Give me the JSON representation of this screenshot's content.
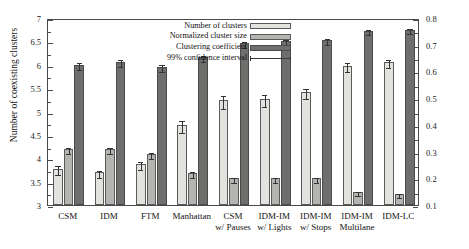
{
  "chart_data": {
    "type": "bar",
    "title": "",
    "categories": [
      "CSM",
      "IDM",
      "FTM",
      "Manhattan",
      "CSM\nw/ Pauses",
      "IDM-IM\nw/ Lights",
      "IDM-IM\nw/ Stops",
      "IDM-IM\nMultilane",
      "IDM-LC"
    ],
    "category_lines": [
      [
        "CSM",
        ""
      ],
      [
        "IDM",
        ""
      ],
      [
        "FTM",
        ""
      ],
      [
        "Manhattan",
        ""
      ],
      [
        "CSM",
        "w/ Pauses"
      ],
      [
        "IDM-IM",
        "w/ Lights"
      ],
      [
        "IDM-IM",
        "w/ Stops"
      ],
      [
        "IDM-IM",
        "Multilane"
      ],
      [
        "IDM-LC",
        ""
      ]
    ],
    "series": [
      {
        "name": "Number of clusters",
        "axis": "left",
        "color": "#e2e2de",
        "values": [
          3.78,
          3.7,
          3.88,
          4.72,
          5.24,
          5.26,
          5.42,
          5.98,
          6.06
        ],
        "errors": [
          0.1,
          0.08,
          0.08,
          0.13,
          0.14,
          0.13,
          0.11,
          0.1,
          0.09
        ]
      },
      {
        "name": "Normalized cluster size",
        "axis": "right",
        "color": "#b4b4b0",
        "values": [
          0.31,
          0.31,
          0.29,
          0.22,
          0.2,
          0.2,
          0.2,
          0.15,
          0.14
        ],
        "errors": [
          0.012,
          0.012,
          0.012,
          0.01,
          0.009,
          0.009,
          0.009,
          0.008,
          0.008
        ]
      },
      {
        "name": "Clustering coefficient",
        "axis": "right",
        "color": "#6e6e6c",
        "values": [
          0.625,
          0.636,
          0.617,
          0.655,
          0.705,
          0.713,
          0.718,
          0.752,
          0.757
        ],
        "errors": [
          0.014,
          0.013,
          0.013,
          0.012,
          0.011,
          0.011,
          0.01,
          0.01,
          0.01
        ]
      }
    ],
    "legend_entries": [
      {
        "label": "Number of clusters",
        "kind": "swatch",
        "series": 0
      },
      {
        "label": "Normalized cluster size",
        "kind": "swatch",
        "series": 1
      },
      {
        "label": "Clustering coefficient",
        "kind": "swatch",
        "series": 2
      },
      {
        "label": "99% confidence interval",
        "kind": "line",
        "series": null
      }
    ],
    "legend_position": "top-center",
    "grid": false,
    "axes": {
      "left": {
        "label": "Number of coexisting clusters",
        "min": 3,
        "max": 7,
        "ticks": [
          3,
          3.5,
          4,
          4.5,
          5,
          5.5,
          6,
          6.5,
          7
        ],
        "tick_labels": [
          "3",
          "3.5",
          "4",
          "4.5",
          "5",
          "5.5",
          "6",
          "6.5",
          "7"
        ]
      },
      "right": {
        "label": "Normalized cluster size and clustering coefficient",
        "min": 0.1,
        "max": 0.8,
        "ticks": [
          0.1,
          0.2,
          0.3,
          0.4,
          0.5,
          0.6,
          0.7,
          0.8
        ],
        "tick_labels": [
          "0.1",
          "0.2",
          "0.3",
          "0.4",
          "0.5",
          "0.6",
          "0.7",
          "0.8"
        ]
      },
      "bottom": {
        "label": ""
      }
    },
    "colors": {
      "series0": "#e2e2de",
      "series1": "#b4b4b0",
      "series2": "#6e6e6c",
      "axis": "#4a4a4a",
      "error": "#333333",
      "background": "#ffffff"
    }
  }
}
